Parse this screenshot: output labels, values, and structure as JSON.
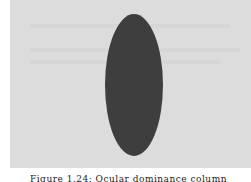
{
  "figure": {
    "background_color": "#dcdcdc",
    "shape": "ellipse",
    "shape_color": "#3e3e3e",
    "caption": "Figure 1.24: Ocular dominance column"
  }
}
